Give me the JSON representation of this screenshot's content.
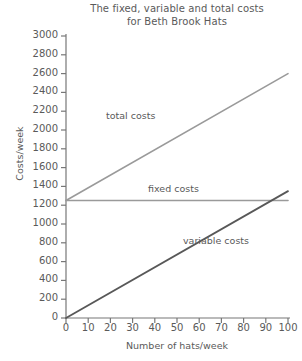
{
  "chart_data": {
    "type": "line",
    "title": "The fixed, variable and total costs for Beth Brook Hats",
    "title_lines": [
      "The fixed, variable and total costs",
      "for Beth Brook Hats"
    ],
    "xlabel": "Number of hats/week",
    "ylabel": "Costs/week",
    "xlim": [
      0,
      100
    ],
    "ylim": [
      0,
      3000
    ],
    "xticks": [
      0,
      10,
      20,
      30,
      40,
      50,
      60,
      70,
      80,
      90,
      100
    ],
    "xtick_labels": [
      "0",
      "10",
      "20",
      "30",
      "40",
      "50",
      "60",
      "70",
      "80",
      "90",
      "100"
    ],
    "yticks": [
      0,
      200,
      400,
      600,
      800,
      1000,
      1200,
      1400,
      1600,
      1800,
      2000,
      2200,
      2400,
      2600,
      2800,
      3000
    ],
    "ytick_labels": [
      "0",
      "200",
      "400",
      "600",
      "800",
      "1000",
      "1200",
      "1400",
      "1600",
      "1800",
      "2000",
      "2200",
      "2400",
      "2600",
      "2800",
      "3000"
    ],
    "grid": false,
    "legend_position": "inline-annotations",
    "x": [
      0,
      100
    ],
    "series": [
      {
        "name": "total costs",
        "label": "total costs",
        "values": [
          1250,
          2600
        ],
        "color": "#9a9a9a",
        "width": 1.6
      },
      {
        "name": "fixed costs",
        "label": "fixed costs",
        "values": [
          1250,
          1250
        ],
        "color": "#9a9a9a",
        "width": 1.6
      },
      {
        "name": "variable costs",
        "label": "variable costs",
        "values": [
          0,
          1350
        ],
        "color": "#585858",
        "width": 1.8
      }
    ],
    "annotations": [
      {
        "text": "total costs",
        "x": 22,
        "y": 1900
      },
      {
        "text": "fixed costs",
        "x": 48,
        "y": 1420
      },
      {
        "text": "variable costs",
        "x": 62,
        "y": 870
      }
    ],
    "axis_color": "#777777",
    "text_color": "#5a5a5a",
    "background": "#ffffff"
  }
}
